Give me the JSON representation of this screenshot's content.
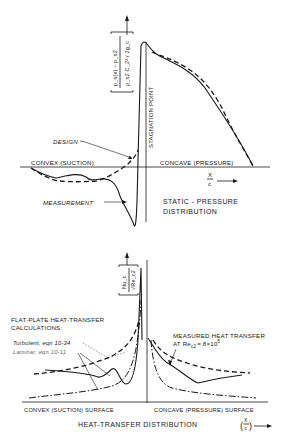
{
  "top_plot": {
    "title_line1": "STATIC - PRESSURE",
    "title_line2": "DISTRIBUTION",
    "y_axis_label": "[ (p_s(x) − p_s,2) / (ρ_s,2 C_2² / 2g_c) ]",
    "y_axis_num": "p_s(x) − p_s2",
    "y_axis_den": "ρ_s2 C_2² / 2g_c",
    "stagnation_label": "STAGNATION POINT",
    "convex_label": "CONVEX (SUCTION)",
    "concave_label": "CONCAVE (PRESSURE)",
    "x_axis_label_num": "X",
    "x_axis_label_den": "c",
    "design_label": "DESIGN",
    "measurement_label": "MEASUREMENT"
  },
  "bottom_plot": {
    "title": "HEAT-TRANSFER DISTRIBUTION",
    "y_axis_num": "Nu_c",
    "y_axis_den": "√Re_c2",
    "flat_plate_line1": "FLAT-PLATE HEAT-TRANSFER",
    "flat_plate_line2": "CALCULATIONS:",
    "turbulent_label": "Turbulent, eqn 10-34",
    "laminar_label": "Laminar, eqn 10-11",
    "measured_line1": "MEASURED HEAT TRANSFER",
    "measured_line2_prefix": "AT Re",
    "measured_line2_sub": "c2",
    "measured_line2_value": "= 8×10",
    "measured_line2_exp": "5",
    "convex_surface_label": "CONVEX (SUCTION) SURFACE",
    "concave_surface_label": "CONCAVE (PRESSURE) SURFACE",
    "x_axis_label_num": "X",
    "x_axis_label_den": "c"
  },
  "legend": {
    "solid": "measurement",
    "dashed": "design / turbulent flat-plate",
    "dash_dot": "laminar flat-plate"
  }
}
